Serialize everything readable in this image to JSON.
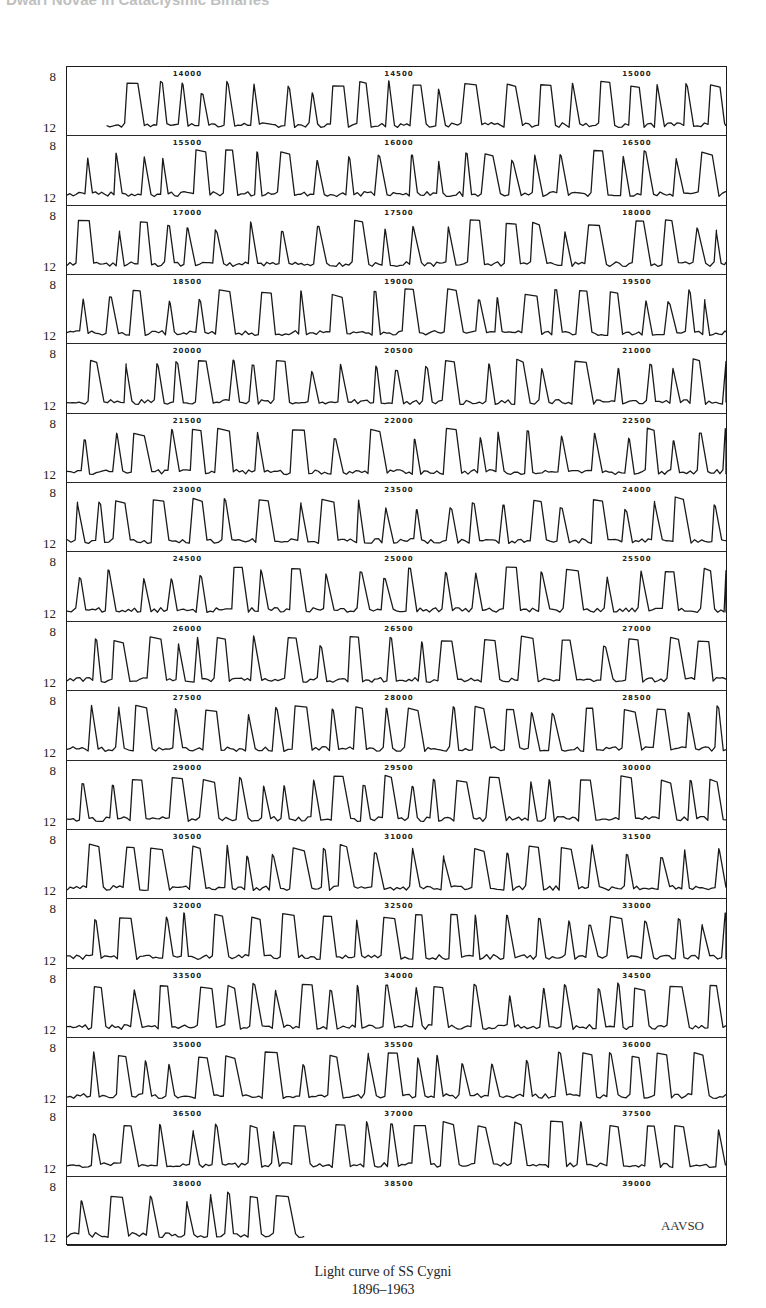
{
  "header": {
    "cut_text": "Dwarf Novae in Cataclysmic Binaries"
  },
  "chart_data": {
    "type": "line",
    "title": "Light curve of SS Cygni",
    "subtitle": "1896–1963",
    "xlabel": "Julian Day (2400000+)",
    "ylabel": "Magnitude",
    "ylim": [
      12,
      8
    ],
    "y_ticks": [
      "8",
      "12"
    ],
    "source_label": "AAVSO",
    "grid": false,
    "legend": null,
    "rows": [
      {
        "labels": [
          "14000",
          "14500",
          "15000"
        ],
        "start_frac": 0.06,
        "end_frac": 1.0
      },
      {
        "labels": [
          "15500",
          "16000",
          "16500"
        ],
        "start_frac": 0.0,
        "end_frac": 1.0
      },
      {
        "labels": [
          "17000",
          "17500",
          "18000"
        ],
        "start_frac": 0.0,
        "end_frac": 1.0
      },
      {
        "labels": [
          "18500",
          "19000",
          "19500"
        ],
        "start_frac": 0.0,
        "end_frac": 1.0
      },
      {
        "labels": [
          "20000",
          "20500",
          "21000"
        ],
        "start_frac": 0.0,
        "end_frac": 1.0
      },
      {
        "labels": [
          "21500",
          "22000",
          "22500"
        ],
        "start_frac": 0.0,
        "end_frac": 1.0
      },
      {
        "labels": [
          "23000",
          "23500",
          "24000"
        ],
        "start_frac": 0.0,
        "end_frac": 1.0
      },
      {
        "labels": [
          "24500",
          "25000",
          "25500"
        ],
        "start_frac": 0.0,
        "end_frac": 1.0
      },
      {
        "labels": [
          "26000",
          "26500",
          "27000"
        ],
        "start_frac": 0.0,
        "end_frac": 1.0
      },
      {
        "labels": [
          "27500",
          "28000",
          "28500"
        ],
        "start_frac": 0.0,
        "end_frac": 1.0
      },
      {
        "labels": [
          "29000",
          "29500",
          "30000"
        ],
        "start_frac": 0.0,
        "end_frac": 1.0
      },
      {
        "labels": [
          "30500",
          "31000",
          "31500"
        ],
        "start_frac": 0.0,
        "end_frac": 1.0
      },
      {
        "labels": [
          "32000",
          "32500",
          "33000"
        ],
        "start_frac": 0.0,
        "end_frac": 1.0
      },
      {
        "labels": [
          "33500",
          "34000",
          "34500"
        ],
        "start_frac": 0.0,
        "end_frac": 1.0
      },
      {
        "labels": [
          "35000",
          "35500",
          "36000"
        ],
        "start_frac": 0.0,
        "end_frac": 1.0
      },
      {
        "labels": [
          "36500",
          "37000",
          "37500"
        ],
        "start_frac": 0.0,
        "end_frac": 1.0
      },
      {
        "labels": [
          "38000",
          "38500",
          "39000"
        ],
        "start_frac": 0.0,
        "end_frac": 0.36
      }
    ],
    "quiescent_magnitude": 12,
    "outburst_peak_magnitude": 8.2,
    "typical_outburst_interval_days": 50
  },
  "caption": {
    "line1": "Light curve of SS Cygni",
    "line2": "1896–1963"
  },
  "colors": {
    "line": "#1a1a1a",
    "frame": "#1a1a1a",
    "background": "#ffffff"
  }
}
